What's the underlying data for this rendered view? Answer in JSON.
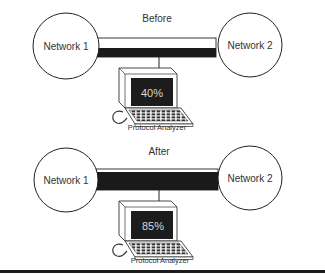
{
  "before": {
    "title": "Before",
    "network_left": "Network 1",
    "network_right": "Network 2",
    "utilization": "40%",
    "analyzer_label": "Protocol Analyzer"
  },
  "after": {
    "title": "After",
    "network_left": "Network 1",
    "network_right": "Network 2",
    "utilization": "85%",
    "analyzer_label": "Protocol Analyzer"
  },
  "colors": {
    "ink": "#222222",
    "traffic": "#1a1a1a",
    "screen": "#1c1c1c",
    "screen_text": "#d8d8d8"
  }
}
